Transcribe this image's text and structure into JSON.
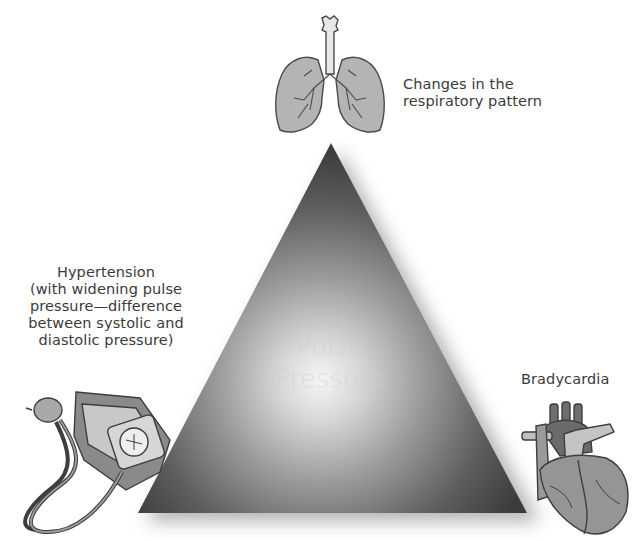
{
  "diagram": {
    "type": "triangle-triad",
    "center_label_faint": "Pulse Pressure",
    "vertices": [
      {
        "id": "top",
        "icon": "lungs-icon",
        "label_lines": [
          "Changes in the",
          "respiratory pattern"
        ]
      },
      {
        "id": "bottom-left",
        "icon": "blood-pressure-cuff-icon",
        "label_lines": [
          "Hypertension",
          "(with widening pulse",
          "pressure—difference",
          "between systolic and",
          "diastolic pressure)"
        ]
      },
      {
        "id": "bottom-right",
        "icon": "heart-icon",
        "label_lines": [
          "Bradycardia"
        ]
      }
    ],
    "colors": {
      "triangle_edge": "#3c3c3c",
      "triangle_center": "#f4f4f4",
      "icon_fill": "#a9a9a9",
      "icon_stroke": "#4a4a4a",
      "text": "#3a3a3a",
      "background": "#ffffff"
    }
  }
}
